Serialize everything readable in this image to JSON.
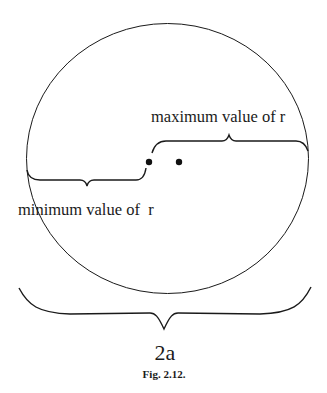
{
  "figure": {
    "caption": "Fig. 2.12.",
    "labels": {
      "maximum": "maximum value of r",
      "minimum": "minimum value of  r",
      "diameter": "2a"
    },
    "elements": {
      "circle": "orbit ellipse",
      "points": [
        "focus-left",
        "focus-right"
      ],
      "braces": [
        "maximum-r-brace",
        "minimum-r-brace",
        "diameter-brace"
      ]
    },
    "colors": {
      "stroke": "#1a1a1a",
      "background": "#ffffff"
    }
  }
}
